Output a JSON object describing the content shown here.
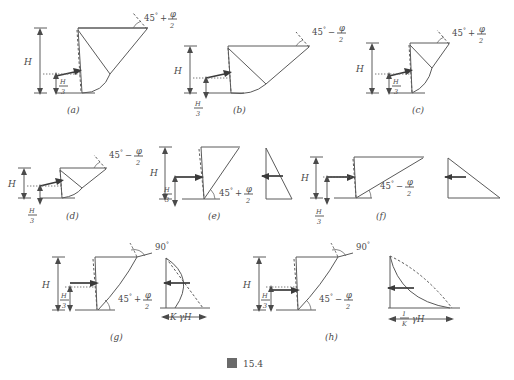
{
  "figure": {
    "caption": "図 15.4",
    "caption_prefix": "図",
    "caption_number": "15.4"
  },
  "labels": {
    "H": "H",
    "H_over_3_num": "H",
    "H_over_3_den": "3",
    "deg": "°",
    "phi": "φ",
    "two": "2",
    "angle_45": "45",
    "angle_90": "90",
    "plus": "+",
    "minus": "−",
    "gammaH": "γH",
    "K": "K",
    "one": "1"
  },
  "panels": [
    {
      "id": "a",
      "letter": "(a)",
      "angle_base": "45",
      "angle_sign": "+",
      "angle_fraction_num": "φ",
      "angle_fraction_den": "2",
      "angle_text": "45°+φ/2",
      "has_H": true,
      "has_H3": true,
      "has_pressure_diagram": false,
      "vertex_angle_label": null
    },
    {
      "id": "b",
      "letter": "(b)",
      "angle_base": "45",
      "angle_sign": "−",
      "angle_fraction_num": "φ",
      "angle_fraction_den": "2",
      "angle_text": "45°−φ/2",
      "has_H": true,
      "has_H3": true,
      "has_pressure_diagram": false,
      "vertex_angle_label": null
    },
    {
      "id": "c",
      "letter": "(c)",
      "angle_base": "45",
      "angle_sign": "+",
      "angle_fraction_num": "φ",
      "angle_fraction_den": "2",
      "angle_text": "45°+φ/2",
      "has_H": true,
      "has_H3": true,
      "has_pressure_diagram": false,
      "vertex_angle_label": null
    },
    {
      "id": "d",
      "letter": "(d)",
      "angle_base": "45",
      "angle_sign": "−",
      "angle_fraction_num": "φ",
      "angle_fraction_den": "2",
      "angle_text": "45°−φ/2",
      "has_H": true,
      "has_H3": true,
      "has_pressure_diagram": false,
      "vertex_angle_label": null
    },
    {
      "id": "e",
      "letter": "(e)",
      "angle_base": "45",
      "angle_sign": "+",
      "angle_fraction_num": "φ",
      "angle_fraction_den": "2",
      "angle_text": "45°+φ/2",
      "has_H": true,
      "has_H3": true,
      "has_pressure_diagram": true,
      "pressure_shape": "triangle-wide-top",
      "vertex_angle_label": null
    },
    {
      "id": "f",
      "letter": "(f)",
      "angle_base": "45",
      "angle_sign": "−",
      "angle_fraction_num": "φ",
      "angle_fraction_den": "2",
      "angle_text": "45°−φ/2",
      "has_H": true,
      "has_H3": true,
      "has_pressure_diagram": true,
      "pressure_shape": "triangle-wide-top-right",
      "vertex_angle_label": null
    },
    {
      "id": "g",
      "letter": "(g)",
      "angle_base": "45",
      "angle_sign": "+",
      "angle_fraction_num": "φ",
      "angle_fraction_den": "2",
      "angle_text": "45°+φ/2",
      "has_H": true,
      "has_H3": true,
      "has_pressure_diagram": true,
      "pressure_shape": "convex-bulge",
      "vertex_angle_label": "90°",
      "pressure_dim_label": "KγH",
      "pressure_dim_k": "K",
      "pressure_dim_rest": "γH"
    },
    {
      "id": "h",
      "letter": "(h)",
      "angle_base": "45",
      "angle_sign": "−",
      "angle_fraction_num": "φ",
      "angle_fraction_den": "2",
      "angle_text": "45°−φ/2",
      "has_H": true,
      "has_H3": true,
      "has_pressure_diagram": true,
      "pressure_shape": "concave-decay",
      "vertex_angle_label": "90°",
      "pressure_dim_label": "(1/K)γH",
      "pressure_dim_num": "1",
      "pressure_dim_den": "K",
      "pressure_dim_rest": "γH"
    }
  ]
}
